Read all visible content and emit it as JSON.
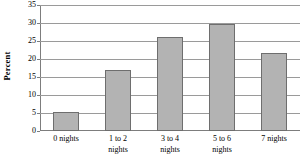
{
  "chart_data": {
    "type": "bar",
    "title": "",
    "subtitle": "",
    "xlabel": "",
    "ylabel": "Percent",
    "categories": [
      "0 nights",
      "1 to 2 nights",
      "3 to 4 nights",
      "5 to 6 nights",
      "7 nights"
    ],
    "category_lines": [
      [
        "0 nights"
      ],
      [
        "1 to 2",
        "nights"
      ],
      [
        "3 to 4",
        "nights"
      ],
      [
        "5 to 6",
        "nights"
      ],
      [
        "7 nights"
      ]
    ],
    "values": [
      5.2,
      17,
      26,
      29.8,
      21.6
    ],
    "ylim": [
      0,
      35
    ],
    "ytick_values": [
      0,
      5,
      10,
      15,
      20,
      25,
      30,
      35
    ],
    "ytick_labels": [
      "0",
      "5",
      "10",
      "15",
      "20",
      "25",
      "30",
      "35"
    ],
    "grid": true,
    "grid_axis": "y",
    "legend": false,
    "legend_position": "none",
    "bar_color": "#b3b3b3",
    "bar_border_color": "#6e6e6e",
    "gridline_color": "#9a9a9a",
    "axis_color": "#7d7d7d",
    "background_color": "#ffffff"
  }
}
